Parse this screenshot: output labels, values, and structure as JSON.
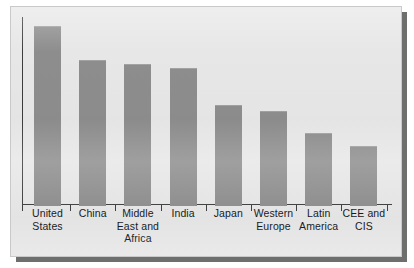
{
  "figure": {
    "panel_background": "#e7e7e7",
    "bar_color": "#8d8d8d",
    "axis_color": "#3c3c3c",
    "shadow_color": "#6e6e6e"
  },
  "chart_data": {
    "type": "bar",
    "title": "",
    "subtitle": "",
    "xlabel": "",
    "ylabel": "",
    "grid": false,
    "legend": null,
    "axis_tick_labels_y": [],
    "ylim": [
      0,
      100
    ],
    "categories": [
      "United States",
      "China",
      "Middle East and Africa",
      "India",
      "Japan",
      "Western Europe",
      "Latin America",
      "CEE and CIS"
    ],
    "category_lines": [
      [
        "United",
        "States"
      ],
      [
        "China"
      ],
      [
        "Middle",
        "East and",
        "Africa"
      ],
      [
        "India"
      ],
      [
        "Japan"
      ],
      [
        "Western",
        "Europe"
      ],
      [
        "Latin",
        "America"
      ],
      [
        "CEE and",
        "CIS"
      ]
    ],
    "values": [
      96,
      78,
      76,
      74,
      54,
      51,
      39,
      32
    ]
  }
}
